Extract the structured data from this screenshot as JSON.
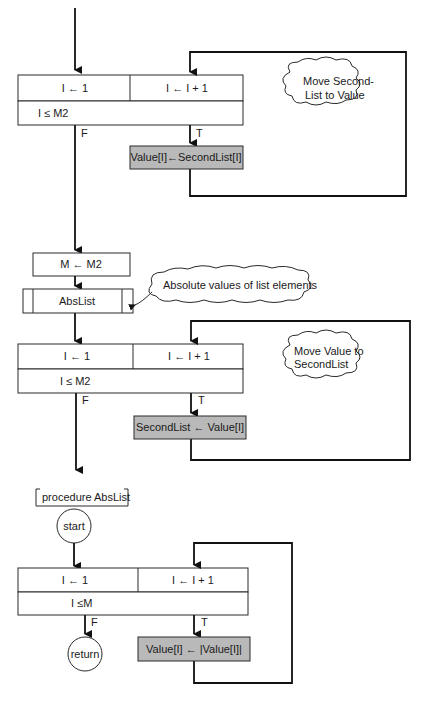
{
  "diagram": {
    "loop1": {
      "init": "I ← 1",
      "increment": "I ← I + 1",
      "condition": "I ≤ M2",
      "false_label": "F",
      "true_label": "T",
      "body": "Value[I]←SecondList[I]",
      "comment_line1": "Move Second-",
      "comment_line2": "List to Value"
    },
    "assign": "M ← M2",
    "call": {
      "label": "AbsList",
      "comment": "Absolute values of list elements"
    },
    "loop2": {
      "init": "I ← 1",
      "increment": "I ← I + 1",
      "condition": "I ≤ M2",
      "false_label": "F",
      "true_label": "T",
      "body": "SecondList ← Value[I]",
      "comment_line1": "Move Value to",
      "comment_line2": "SecondList"
    },
    "procedure": {
      "header": "procedure AbsList",
      "start": "start",
      "return": "return"
    },
    "loop3": {
      "init": "I ← 1",
      "increment": "I ← I + 1",
      "condition": "I ≤M",
      "false_label": "F",
      "true_label": "T",
      "body": "Value[I] ← |Value[I]|"
    }
  }
}
